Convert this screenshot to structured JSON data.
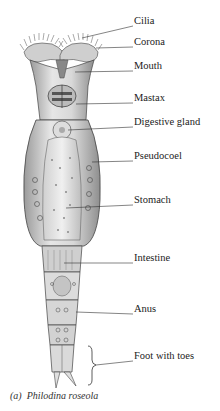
{
  "figure": {
    "caption_letter": "(a)",
    "caption_species": "Philodina roseola",
    "labels": [
      {
        "text": "Cilia",
        "x": 134,
        "y": 21
      },
      {
        "text": "Corona",
        "x": 134,
        "y": 42
      },
      {
        "text": "Mouth",
        "x": 134,
        "y": 66
      },
      {
        "text": "Mastax",
        "x": 134,
        "y": 98
      },
      {
        "text": "Digestive gland",
        "x": 134,
        "y": 122
      },
      {
        "text": "Pseudocoel",
        "x": 134,
        "y": 156
      },
      {
        "text": "Stomach",
        "x": 134,
        "y": 200
      },
      {
        "text": "Intestine",
        "x": 134,
        "y": 258
      },
      {
        "text": "Anus",
        "x": 134,
        "y": 309
      },
      {
        "text": "Foot with toes",
        "x": 134,
        "y": 356
      }
    ]
  }
}
